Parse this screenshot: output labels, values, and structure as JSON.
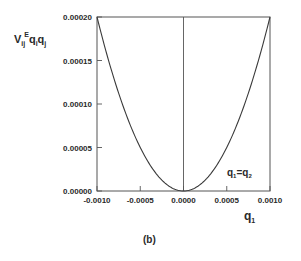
{
  "chart_data": {
    "type": "line",
    "title": "",
    "panel_label": "(b)",
    "xlabel": "q",
    "xlabel_sub": "1",
    "ylabel": {
      "base": "V",
      "sub": "ij",
      "sup": "E",
      "rest1": "q",
      "rest1_sub": "i",
      "rest2": "q",
      "rest2_sub": "j"
    },
    "xlim": [
      -0.001,
      0.001
    ],
    "ylim": [
      0.0,
      0.0002
    ],
    "x_ticks": [
      -0.001,
      -0.0005,
      0.0,
      0.0005,
      0.001
    ],
    "x_tick_labels": [
      "-0.0010",
      "-0.0005",
      "0.0000",
      "0.0005",
      "0.0010"
    ],
    "y_ticks": [
      0.0,
      5e-05,
      0.0001,
      0.00015,
      0.0002
    ],
    "y_tick_labels": [
      "0.00000",
      "0.00005",
      "0.00010",
      "0.00015",
      "0.00020"
    ],
    "grid": false,
    "vertical_reference_line_x": 0.0,
    "annotation": {
      "text": "q",
      "sub1": "1",
      "eq": "=q",
      "sub2": "2"
    },
    "series": [
      {
        "name": "q1=q2",
        "description": "parabola V = 200*q1^2",
        "x": [
          -0.001,
          -0.0009,
          -0.0008,
          -0.0007,
          -0.0006,
          -0.0005,
          -0.0004,
          -0.0003,
          -0.0002,
          -0.0001,
          0.0,
          0.0001,
          0.0002,
          0.0003,
          0.0004,
          0.0005,
          0.0006,
          0.0007,
          0.0008,
          0.0009,
          0.001
        ],
        "y": [
          0.0002,
          0.000162,
          0.000128,
          9.8e-05,
          7.2e-05,
          5e-05,
          3.2e-05,
          1.8e-05,
          8e-06,
          2e-06,
          0.0,
          2e-06,
          8e-06,
          1.8e-05,
          3.2e-05,
          5e-05,
          7.2e-05,
          9.8e-05,
          0.000128,
          0.000162,
          0.0002
        ]
      }
    ],
    "colors": {
      "line": "#3a3a3a",
      "axis": "#555555",
      "text": "#2a2a2a"
    }
  }
}
